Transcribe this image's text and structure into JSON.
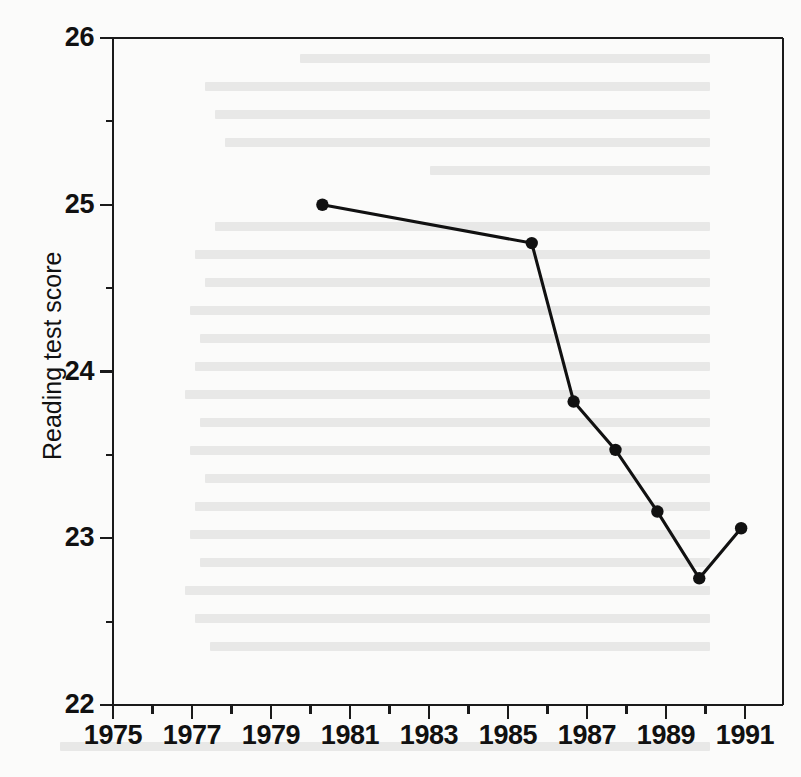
{
  "chart_data": {
    "type": "line",
    "title": "",
    "xlabel": "",
    "ylabel": "Reading test score",
    "xlim": [
      1975,
      1991
    ],
    "ylim": [
      22,
      26
    ],
    "grid": false,
    "legend": null,
    "x_tick_labels": [
      "1975",
      "1977",
      "1979",
      "1981",
      "1983",
      "1985",
      "1987",
      "1989",
      "1991"
    ],
    "x_tick_values": [
      1975,
      1977,
      1979,
      1981,
      1983,
      1985,
      1987,
      1989,
      1991
    ],
    "x_minor_ticks": [
      1976,
      1978,
      1980,
      1982,
      1984,
      1986,
      1988,
      1990
    ],
    "y_tick_labels": [
      "22",
      "23",
      "24",
      "25",
      "26"
    ],
    "y_tick_values": [
      22,
      23,
      24,
      25,
      26
    ],
    "y_minor_ticks": [
      22.5,
      23.5,
      24.5,
      25.5
    ],
    "marker": "filled-circle",
    "line_color": "#111111",
    "marker_color": "#111111",
    "background_color": "#fbfbfa",
    "x": [
      1980,
      1985,
      1986,
      1987,
      1988,
      1989,
      1990
    ],
    "values": [
      25.0,
      24.77,
      23.82,
      23.53,
      23.16,
      22.76,
      23.06
    ],
    "series": [
      {
        "name": "Reading test score",
        "x": [
          1980,
          1985,
          1986,
          1987,
          1988,
          1989,
          1990
        ],
        "values": [
          25.0,
          24.77,
          23.82,
          23.53,
          23.16,
          22.76,
          23.06
        ]
      }
    ]
  },
  "axes": {
    "y_title": "Reading test score"
  }
}
